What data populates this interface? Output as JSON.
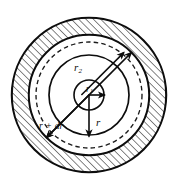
{
  "figure": {
    "background_color": "#ffffff",
    "stroke_color": "#0d0d0d",
    "hatch_color": "#2b2b2b",
    "center": {
      "x": 89,
      "y": 95
    },
    "labels": {
      "outer_radius": "r",
      "outer_radius_sub": "2",
      "inner_radius": "r",
      "inner_radius_sub": "1",
      "element_radius": "r",
      "element_radius_plus": "r + dr"
    },
    "circles": [
      {
        "name": "outer-boundary-circle",
        "radius": 78,
        "style": "solid"
      },
      {
        "name": "r2-circle",
        "radius": 60,
        "style": "solid"
      },
      {
        "name": "r-plus-dr-dashed-circle",
        "radius": 53,
        "style": "dashed"
      },
      {
        "name": "r-circle",
        "radius": 40,
        "style": "solid"
      },
      {
        "name": "r1-circle",
        "radius": 15,
        "style": "solid"
      }
    ],
    "hatched_region": {
      "name": "outer-annulus-hatch",
      "inner_radius": 60,
      "outer_radius": 78,
      "angle_deg": 45
    },
    "arrows": [
      {
        "name": "r2-dimension-arrow",
        "type": "double-headed",
        "from_angle_deg": 225,
        "to_angle_deg": 135,
        "length": 60
      },
      {
        "name": "r1-dimension-arrow",
        "type": "single-headed",
        "direction": "right",
        "length": 15
      },
      {
        "name": "r-dimension-arrow",
        "type": "single-headed",
        "direction": "down",
        "length": 40
      }
    ]
  }
}
